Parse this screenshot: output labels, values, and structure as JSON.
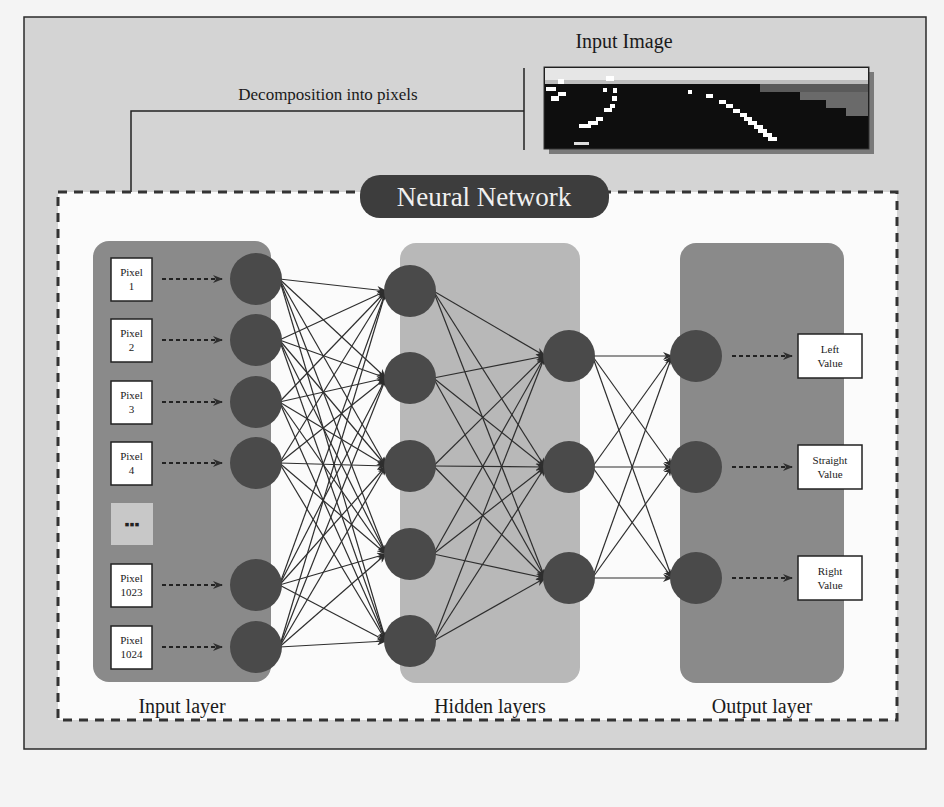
{
  "diagram": {
    "title": "Neural Network",
    "input_image_label": "Input Image",
    "decomposition_label": "Decomposition into pixels",
    "colors": {
      "outer_bg": "#d4d4d4",
      "outer_border": "#2a2a2a",
      "inner_bg": "#fbfbfb",
      "dash": "#333333",
      "title_pill": "#3d3d3d",
      "input_layer_bg": "#8a8a8a",
      "hidden_layer_bg": "#b8b8b8",
      "output_layer_bg": "#8a8a8a",
      "node": "#4a4a4a",
      "edge": "#2e2e2e",
      "label_box_bg": "#ffffff",
      "ellipsis_box_bg": "#c8c8c8"
    },
    "layers": [
      {
        "name": "Input layer",
        "label": "Input layer"
      },
      {
        "name": "Hidden layers",
        "label": "Hidden layers"
      },
      {
        "name": "Output layer",
        "label": "Output layer"
      }
    ],
    "input_pixels": [
      {
        "line1": "Pixel",
        "line2": "1"
      },
      {
        "line1": "Pixel",
        "line2": "2"
      },
      {
        "line1": "Pixel",
        "line2": "3"
      },
      {
        "line1": "Pixel",
        "line2": "4"
      },
      {
        "line1": "",
        "line2": "",
        "ellipsis": true
      },
      {
        "line1": "Pixel",
        "line2": "1023"
      },
      {
        "line1": "Pixel",
        "line2": "1024"
      }
    ],
    "ellipsis_glyph": "▪▪▪",
    "outputs": [
      {
        "line1": "Left",
        "line2": "Value"
      },
      {
        "line1": "Straight",
        "line2": "Value"
      },
      {
        "line1": "Right",
        "line2": "Value"
      }
    ],
    "network": {
      "input_nodes": 6,
      "hidden1_nodes": 5,
      "hidden2_nodes": 3,
      "output_nodes": 3
    }
  }
}
